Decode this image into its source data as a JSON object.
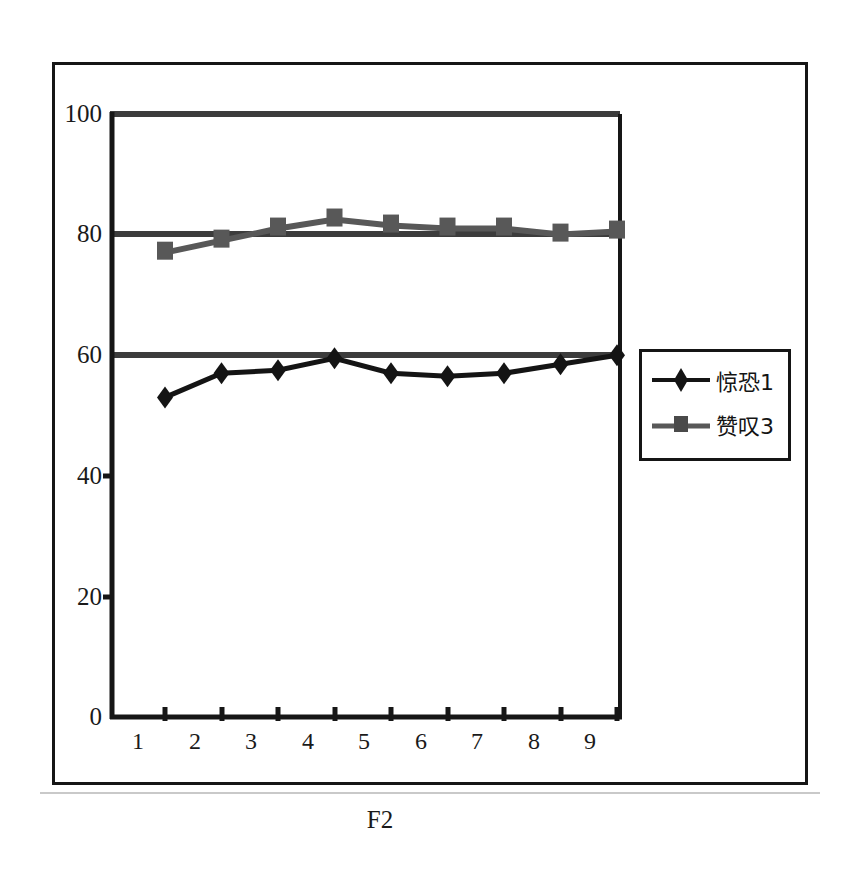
{
  "chart_data": {
    "type": "line",
    "title": "",
    "subtitle": "",
    "xlabel": "F2",
    "ylabel": "",
    "categories": [
      "1",
      "2",
      "3",
      "4",
      "5",
      "6",
      "7",
      "8",
      "9"
    ],
    "yticks": [
      "0",
      "20",
      "40",
      "60",
      "80",
      "100"
    ],
    "ylim": [
      0,
      100
    ],
    "grid": true,
    "grid_values": [
      60,
      80,
      100
    ],
    "legend_position": "right",
    "series": [
      {
        "name": "惊恐1",
        "marker": "diamond",
        "color": "#141414",
        "values": [
          53,
          57,
          57.5,
          59.5,
          57,
          56.5,
          57,
          58.5,
          60
        ]
      },
      {
        "name": "赞叹3",
        "marker": "square",
        "color": "#585858",
        "values": [
          77,
          79,
          81,
          82.5,
          81.5,
          81,
          81,
          80,
          80.5
        ]
      }
    ]
  },
  "axes": {
    "x_title": "F2",
    "x_tick_labels": [
      "1",
      "2",
      "3",
      "4",
      "5",
      "6",
      "7",
      "8",
      "9"
    ],
    "y_tick_labels": [
      "100",
      "80",
      "60",
      "40",
      "20",
      "0"
    ]
  },
  "legend": {
    "entries": [
      {
        "label": "惊恐1",
        "marker": "diamond"
      },
      {
        "label": "赞叹3",
        "marker": "square"
      }
    ]
  },
  "colors": {
    "series1": "#141414",
    "series2": "#585858",
    "axis": "#161616",
    "gridline": "#4a4a4a",
    "background": "#ffffff"
  }
}
